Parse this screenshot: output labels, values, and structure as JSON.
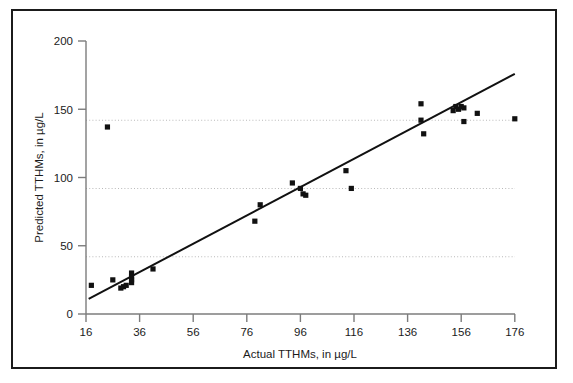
{
  "chart_data": {
    "type": "scatter",
    "title": "",
    "xlabel": "Actual TTHMs, in µg/L",
    "ylabel": "Predicted TTHMs, in µg/L",
    "xlim": [
      16,
      176
    ],
    "ylim": [
      0,
      200
    ],
    "xticks": [
      16,
      36,
      56,
      76,
      96,
      116,
      136,
      156,
      176
    ],
    "yticks": [
      0,
      50,
      100,
      150,
      200
    ],
    "xticklabels": [
      "16",
      "36",
      "56",
      "76",
      "96",
      "116",
      "136",
      "156",
      "176"
    ],
    "yticklabels": [
      "0",
      "50",
      "100",
      "150",
      "200"
    ],
    "grid": "horizontal-dotted",
    "legend": "none",
    "marker": "filled-square",
    "marker_color": "#111111",
    "line_color": "#111111",
    "frame_color": "#1b1b1b",
    "grid_color": "#b9b9b9",
    "series": [
      {
        "name": "Observations",
        "points": [
          [
            18,
            21
          ],
          [
            24,
            137
          ],
          [
            26,
            25
          ],
          [
            29,
            19
          ],
          [
            30,
            20
          ],
          [
            31,
            21
          ],
          [
            33,
            30
          ],
          [
            33,
            27
          ],
          [
            33,
            25
          ],
          [
            33,
            23
          ],
          [
            41,
            33
          ],
          [
            79,
            68
          ],
          [
            81,
            80
          ],
          [
            93,
            96
          ],
          [
            96,
            92
          ],
          [
            97,
            88
          ],
          [
            98,
            87
          ],
          [
            113,
            105
          ],
          [
            115,
            92
          ],
          [
            141,
            154
          ],
          [
            141,
            142
          ],
          [
            142,
            132
          ],
          [
            153,
            149
          ],
          [
            154,
            152
          ],
          [
            155,
            150
          ],
          [
            156,
            152
          ],
          [
            157,
            151
          ],
          [
            157,
            141
          ],
          [
            162,
            147
          ],
          [
            176,
            143
          ]
        ]
      }
    ],
    "trendline": {
      "name": "Regression line",
      "x": [
        17,
        176
      ],
      "y": [
        11,
        176
      ]
    }
  }
}
